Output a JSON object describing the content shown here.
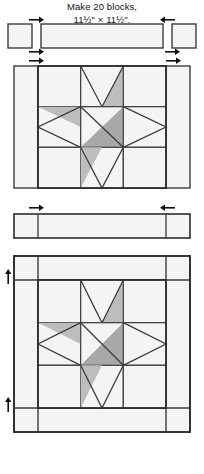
{
  "document": {
    "kind": "quilt-block-assembly-diagram",
    "caption": {
      "line1": "Make 20 blocks,",
      "line2": "11½\" × 11½\"."
    }
  },
  "palette": {
    "background": "#ffffff",
    "outline": "#3c3c3c",
    "outline_heavy": "#2b2b2b",
    "fabric_light": "#f4f4f2",
    "fabric_light_alt": "#eeeeec",
    "fabric_medium": "#bdbdbd",
    "fabric_dark": "#a8a8a8",
    "arrow": "#111111",
    "caption_text": "#141414"
  },
  "stages": [
    {
      "id": "top-strip",
      "name": "Top sashing strip with corner squares",
      "pieces": [
        {
          "name": "corner-square-left",
          "fill": "fabric_light"
        },
        {
          "name": "sashing-rectangle",
          "fill": "fabric_light"
        },
        {
          "name": "corner-square-right",
          "fill": "fabric_light"
        }
      ],
      "arrows": [
        {
          "name": "seam-arrow-top-left",
          "direction": "right"
        },
        {
          "name": "seam-arrow-top-right",
          "direction": "left"
        },
        {
          "name": "seam-arrow-bottom-left",
          "direction": "right"
        },
        {
          "name": "seam-arrow-bottom-right",
          "direction": "left"
        }
      ]
    },
    {
      "id": "side-borders",
      "name": "Star block with side borders attached",
      "pieces": [
        {
          "name": "side-border-left",
          "fill": "fabric_light"
        },
        {
          "name": "star-block",
          "fill": "mixed"
        },
        {
          "name": "side-border-right",
          "fill": "fabric_light"
        }
      ],
      "arrows": [
        {
          "name": "seam-arrow-left",
          "direction": "right"
        },
        {
          "name": "seam-arrow-right",
          "direction": "right"
        }
      ]
    },
    {
      "id": "mid-strip",
      "name": "Joined sashing strip",
      "pieces": [
        {
          "name": "corner-square-left",
          "fill": "fabric_light"
        },
        {
          "name": "sashing-rectangle",
          "fill": "fabric_light"
        },
        {
          "name": "corner-square-right",
          "fill": "fabric_light"
        }
      ],
      "arrows": [
        {
          "name": "seam-arrow-left",
          "direction": "right"
        },
        {
          "name": "seam-arrow-right",
          "direction": "left"
        }
      ]
    },
    {
      "id": "finished-block",
      "name": "Completed bordered star block",
      "pieces": [
        {
          "name": "border-top",
          "fill": "fabric_light"
        },
        {
          "name": "border-bottom",
          "fill": "fabric_light"
        },
        {
          "name": "border-left",
          "fill": "fabric_light"
        },
        {
          "name": "border-right",
          "fill": "fabric_light"
        },
        {
          "name": "star-block",
          "fill": "mixed"
        }
      ],
      "arrows": [
        {
          "name": "seam-arrow-upper-left",
          "direction": "up"
        },
        {
          "name": "seam-arrow-lower-left",
          "direction": "up"
        }
      ]
    }
  ],
  "star_block": {
    "name": "sawtooth-star",
    "grid": "3x3",
    "units": [
      {
        "name": "corner-square-top-left",
        "row": 0,
        "col": 0,
        "type": "plain",
        "fill": "fabric_light"
      },
      {
        "name": "flying-geese-top",
        "row": 0,
        "col": 1,
        "type": "flying-geese",
        "orientation": "up",
        "point_fill": "fabric_light",
        "accent": "right",
        "accent_fill": "fabric_medium"
      },
      {
        "name": "corner-square-top-right",
        "row": 0,
        "col": 2,
        "type": "plain",
        "fill": "fabric_light"
      },
      {
        "name": "flying-geese-left",
        "row": 1,
        "col": 0,
        "type": "flying-geese",
        "orientation": "left",
        "point_fill": "fabric_light",
        "accent": "top",
        "accent_fill": "fabric_medium"
      },
      {
        "name": "center-half-square-triangle",
        "row": 1,
        "col": 1,
        "type": "hst",
        "light_corner": "top-left",
        "dark_fill": "fabric_dark",
        "light_fill": "fabric_light"
      },
      {
        "name": "flying-geese-right",
        "row": 1,
        "col": 2,
        "type": "flying-geese",
        "orientation": "right",
        "point_fill": "fabric_light",
        "accent": "none"
      },
      {
        "name": "corner-square-bottom-left",
        "row": 2,
        "col": 0,
        "type": "plain",
        "fill": "fabric_light"
      },
      {
        "name": "flying-geese-bottom",
        "row": 2,
        "col": 1,
        "type": "flying-geese",
        "orientation": "down",
        "point_fill": "fabric_light",
        "accent": "left",
        "accent_fill": "fabric_medium"
      },
      {
        "name": "corner-square-bottom-right",
        "row": 2,
        "col": 2,
        "type": "plain",
        "fill": "fabric_light"
      }
    ]
  }
}
